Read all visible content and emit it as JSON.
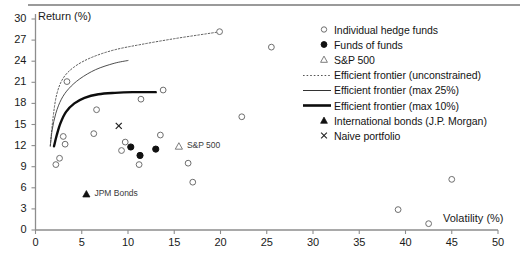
{
  "chart_data": {
    "type": "scatter",
    "title": "",
    "xlabel": "Volatility (%)",
    "ylabel": "Return (%)",
    "xlim": [
      0,
      50
    ],
    "ylim": [
      0,
      30
    ],
    "xticks": [
      0,
      5,
      10,
      15,
      20,
      25,
      30,
      35,
      40,
      45,
      50
    ],
    "yticks": [
      0,
      3,
      6,
      9,
      12,
      15,
      18,
      21,
      24,
      27,
      30
    ],
    "grid": false,
    "legend_position": "right",
    "series": [
      {
        "name": "Individual hedge funds",
        "marker": "open-circle",
        "points": [
          [
            2.2,
            9.3
          ],
          [
            2.6,
            10.2
          ],
          [
            3.0,
            13.3
          ],
          [
            3.2,
            12.2
          ],
          [
            3.4,
            21.1
          ],
          [
            6.3,
            13.7
          ],
          [
            6.6,
            17.1
          ],
          [
            9.3,
            11.3
          ],
          [
            9.7,
            12.5
          ],
          [
            11.2,
            9.3
          ],
          [
            11.4,
            18.6
          ],
          [
            13.5,
            13.5
          ],
          [
            13.8,
            19.9
          ],
          [
            16.5,
            9.5
          ],
          [
            17.0,
            6.8
          ],
          [
            19.9,
            28.2
          ],
          [
            22.3,
            16.1
          ],
          [
            25.5,
            26.0
          ],
          [
            39.2,
            2.9
          ],
          [
            42.5,
            0.9
          ],
          [
            45.0,
            7.2
          ]
        ]
      },
      {
        "name": "Funds of funds",
        "marker": "filled-circle",
        "points": [
          [
            10.3,
            11.8
          ],
          [
            11.3,
            10.6
          ],
          [
            13.0,
            11.5
          ]
        ]
      },
      {
        "name": "S&P 500",
        "marker": "open-triangle",
        "points": [
          [
            15.5,
            11.9
          ]
        ]
      },
      {
        "name": "International bonds (J.P. Morgan)",
        "marker": "filled-triangle",
        "points": [
          [
            5.5,
            5.1
          ]
        ]
      },
      {
        "name": "Naive portfolio",
        "marker": "cross-x",
        "points": [
          [
            9.0,
            14.8
          ]
        ]
      }
    ],
    "curves": [
      {
        "name": "Efficient frontier (unconstrained)",
        "style": "dotted",
        "points": [
          [
            1.6,
            12.0
          ],
          [
            1.9,
            16.0
          ],
          [
            2.3,
            19.3
          ],
          [
            3.0,
            21.6
          ],
          [
            4.2,
            23.2
          ],
          [
            6.0,
            24.5
          ],
          [
            8.5,
            25.6
          ],
          [
            11.5,
            26.4
          ],
          [
            15.0,
            27.2
          ],
          [
            18.5,
            27.9
          ],
          [
            20.0,
            28.2
          ]
        ]
      },
      {
        "name": "Efficient frontier (max 25%)",
        "style": "thin-solid",
        "points": [
          [
            1.6,
            11.9
          ],
          [
            1.8,
            14.2
          ],
          [
            2.2,
            16.6
          ],
          [
            2.8,
            18.6
          ],
          [
            3.6,
            20.1
          ],
          [
            4.8,
            21.5
          ],
          [
            6.5,
            22.8
          ],
          [
            8.5,
            23.7
          ],
          [
            10.0,
            24.1
          ]
        ]
      },
      {
        "name": "Efficient frontier (max 10%)",
        "style": "thick-solid",
        "points": [
          [
            2.0,
            11.9
          ],
          [
            2.3,
            13.5
          ],
          [
            2.7,
            15.2
          ],
          [
            3.3,
            16.8
          ],
          [
            4.2,
            18.0
          ],
          [
            5.3,
            18.8
          ],
          [
            6.8,
            19.3
          ],
          [
            8.6,
            19.5
          ],
          [
            10.5,
            19.6
          ],
          [
            12.0,
            19.6
          ],
          [
            13.0,
            19.6
          ]
        ]
      }
    ],
    "annotations": [
      {
        "text": "S&P 500",
        "x": 15.5,
        "y": 11.9,
        "marker": "open-triangle"
      },
      {
        "text": "JPM Bonds",
        "x": 5.5,
        "y": 5.1,
        "marker": "filled-triangle"
      }
    ]
  },
  "axes": {
    "y_title": "Return (%)",
    "x_title": "Volatility (%)",
    "y_tick_labels": [
      "30",
      "27",
      "24",
      "21",
      "18",
      "15",
      "12",
      "9",
      "6",
      "3",
      "0"
    ],
    "x_tick_labels": [
      "0",
      "5",
      "10",
      "15",
      "20",
      "25",
      "30",
      "35",
      "40",
      "45",
      "50"
    ]
  },
  "legend": {
    "items": [
      {
        "label": "Individual hedge funds",
        "key": "open-circle-icon"
      },
      {
        "label": "Funds of funds",
        "key": "filled-circle-icon"
      },
      {
        "label": "S&P 500",
        "key": "open-triangle-icon"
      },
      {
        "label": "Efficient frontier (unconstrained)",
        "key": "dotted-line-icon"
      },
      {
        "label": "Efficient frontier (max 25%)",
        "key": "thin-line-icon"
      },
      {
        "label": "Efficient frontier (max 10%)",
        "key": "thick-line-icon"
      },
      {
        "label": "International bonds (J.P. Morgan)",
        "key": "filled-triangle-icon"
      },
      {
        "label": "Naive portfolio",
        "key": "cross-x-icon"
      }
    ]
  },
  "annotation_labels": {
    "sp500": "S&P 500",
    "jpm_bonds": "JPM Bonds"
  },
  "colors": {
    "axis": "#8d8d8d",
    "marker_stroke": "#6e6e6e",
    "marker_fill_dark": "#111111",
    "curve_dark": "#111111",
    "curve_thin": "#555555",
    "text": "#1a1a1a",
    "rule": "#9a9a9a"
  }
}
